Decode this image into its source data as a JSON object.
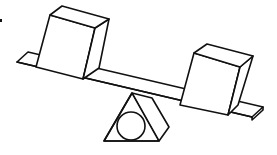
{
  "diagram": {
    "colors": {
      "stroke": "#111111",
      "background": "#ffffff"
    },
    "elements": [
      {
        "id": "plank",
        "label": "seesaw plank"
      },
      {
        "id": "left-box",
        "label": "left box"
      },
      {
        "id": "right-box",
        "label": "right box"
      },
      {
        "id": "fulcrum",
        "label": "triangular fulcrum"
      },
      {
        "id": "roller",
        "label": "circle in fulcrum"
      },
      {
        "id": "mark",
        "label": "small mark"
      }
    ]
  }
}
